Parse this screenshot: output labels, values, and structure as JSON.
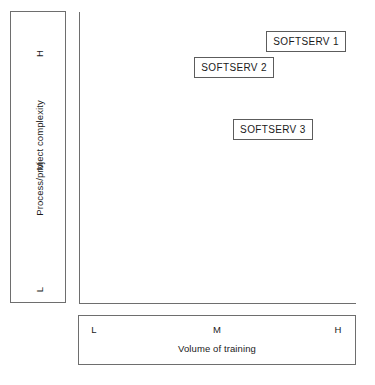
{
  "chart_data": {
    "type": "scatter",
    "title": "",
    "xlabel": "Volume of training",
    "ylabel": "Process/project complexity",
    "x_ticks": [
      "L",
      "M",
      "H"
    ],
    "y_ticks": [
      "H",
      "M",
      "L"
    ],
    "grid": false,
    "legend": "none",
    "xlim": [
      "L",
      "H"
    ],
    "ylim": [
      "L",
      "H"
    ],
    "points": [
      {
        "label": "SOFTSERV 1",
        "x_frac": 0.82,
        "y_frac": 0.9
      },
      {
        "label": "SOFTSERV 2",
        "x_frac": 0.56,
        "y_frac": 0.81
      },
      {
        "label": "SOFTSERV 3",
        "x_frac": 0.7,
        "y_frac": 0.6
      }
    ]
  },
  "axes": {
    "y": {
      "title": "Process/project complexity",
      "tick_high": "H",
      "tick_mid": "M",
      "tick_low": "L"
    },
    "x": {
      "title": "Volume of training",
      "tick_low": "L",
      "tick_mid": "M",
      "tick_high": "H"
    }
  },
  "points": {
    "p0": {
      "label": "SOFTSERV 1"
    },
    "p1": {
      "label": "SOFTSERV 2"
    },
    "p2": {
      "label": "SOFTSERV 3"
    }
  },
  "colors": {
    "border": "#6e6e6e",
    "box_border": "#5c5c5c",
    "text": "#1a1a1a",
    "background": "#ffffff"
  }
}
